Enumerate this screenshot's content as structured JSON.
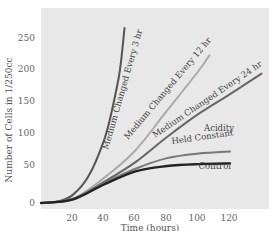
{
  "chart_data": {
    "type": "line",
    "title": "",
    "xlabel": "Time (hours)",
    "ylabel": "Number of Cells in 1/250cc",
    "xlim": [
      0,
      145
    ],
    "ylim": [
      0,
      265
    ],
    "xticks": [
      20,
      40,
      60,
      80,
      100,
      120
    ],
    "yticks": [
      0,
      50,
      100,
      150,
      200,
      250
    ],
    "grid": false,
    "legend": "inline labels",
    "colors": {
      "background": "#e8e8e8",
      "3hr": "#555555",
      "12hr": "#aaaaaa",
      "24hr": "#666666",
      "acidity": "#777777",
      "control": "#222222"
    },
    "series": [
      {
        "name": "Medium Changed Every 3 hr",
        "key": "3hr",
        "x": [
          0,
          10,
          20,
          30,
          40,
          45,
          50,
          53
        ],
        "y": [
          0,
          2,
          12,
          40,
          95,
          140,
          200,
          265
        ]
      },
      {
        "name": "Medium Changed Every 12 hr",
        "key": "12hr",
        "x": [
          0,
          20,
          40,
          60,
          80,
          100,
          107
        ],
        "y": [
          0,
          6,
          38,
          80,
          140,
          200,
          224
        ]
      },
      {
        "name": "Medium Changed Every 24 hr",
        "key": "24hr",
        "x": [
          0,
          20,
          40,
          60,
          80,
          100,
          120,
          140
        ],
        "y": [
          0,
          6,
          32,
          62,
          100,
          135,
          165,
          196
        ]
      },
      {
        "name": "Acidity Held Constant",
        "key": "acidity",
        "x": [
          0,
          20,
          40,
          60,
          80,
          100,
          120
        ],
        "y": [
          0,
          6,
          30,
          52,
          68,
          75,
          78
        ]
      },
      {
        "name": "Control",
        "key": "control",
        "x": [
          0,
          20,
          40,
          60,
          80,
          100,
          120
        ],
        "y": [
          0,
          5,
          28,
          48,
          56,
          59,
          60
        ]
      }
    ],
    "annotations": [
      {
        "text": "Medium Changed Every 3 hr",
        "series": "3hr"
      },
      {
        "text": "Medium Changed Every 12 hr",
        "series": "12hr"
      },
      {
        "text": "Medium Changed Every 24 hr",
        "series": "24hr"
      },
      {
        "text": "Acidity",
        "series": "acidity"
      },
      {
        "text": "Held Constant",
        "series": "acidity"
      },
      {
        "text": "Control",
        "series": "control"
      }
    ]
  },
  "labels": {
    "xlabel": "Time (hours)",
    "ylabel": "Number of Cells in 1/250cc",
    "xticks": [
      "20",
      "40",
      "60",
      "80",
      "100",
      "120"
    ],
    "yticks": [
      "0",
      "50",
      "100",
      "150",
      "200",
      "250"
    ],
    "s3hr": "Medium Changed Every 3 hr",
    "s12hr": "Medium Changed Every 12 hr",
    "s24hr": "Medium Changed Every 24 hr",
    "acidity1": "Acidity",
    "acidity2": "Held Constant",
    "control": "Control"
  }
}
